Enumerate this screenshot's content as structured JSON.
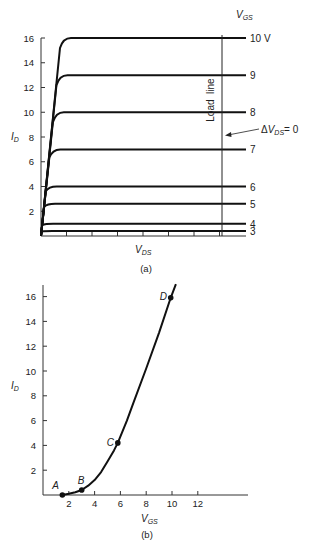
{
  "chart_data": [
    {
      "id": "a",
      "type": "line",
      "caption": "(a)",
      "title": "",
      "xlabel": "V_DS",
      "ylabel": "I_D",
      "legend_title": "V_GS",
      "yticks": [
        2,
        4,
        6,
        8,
        10,
        12,
        14,
        16
      ],
      "ylim": [
        0,
        16
      ],
      "x_minor_ticks": 7,
      "grid": false,
      "series": [
        {
          "name": "10 V",
          "vgs": 10,
          "saturation_current": 16,
          "label": "10 V"
        },
        {
          "name": "9",
          "vgs": 9,
          "saturation_current": 13,
          "label": "9"
        },
        {
          "name": "8",
          "vgs": 8,
          "saturation_current": 10,
          "label": "8"
        },
        {
          "name": "7",
          "vgs": 7,
          "saturation_current": 7,
          "label": "7"
        },
        {
          "name": "6",
          "vgs": 6,
          "saturation_current": 4,
          "label": "6"
        },
        {
          "name": "5",
          "vgs": 5,
          "saturation_current": 2.6,
          "label": "5"
        },
        {
          "name": "4",
          "vgs": 4,
          "saturation_current": 1,
          "label": "4"
        },
        {
          "name": "3",
          "vgs": 3,
          "saturation_current": 0.4,
          "label": "3"
        }
      ],
      "annotations": {
        "load_line_label": "Load  line",
        "delta_label": "ΔV",
        "delta_sub": "DS",
        "delta_suffix": "= 0"
      }
    },
    {
      "id": "b",
      "type": "line",
      "caption": "(b)",
      "title": "",
      "xlabel": "V_GS",
      "ylabel": "I_D",
      "xticks": [
        2,
        4,
        6,
        8,
        10,
        12
      ],
      "yticks": [
        2,
        4,
        6,
        8,
        10,
        12,
        14,
        16
      ],
      "xlim": [
        0,
        15.5
      ],
      "ylim": [
        0,
        16.8
      ],
      "grid": false,
      "points": [
        {
          "label": "A",
          "x": 1.5,
          "y": 0
        },
        {
          "label": "B",
          "x": 3,
          "y": 0.4
        },
        {
          "label": "C",
          "x": 5.8,
          "y": 4.2
        },
        {
          "label": "D",
          "x": 9.9,
          "y": 15.9
        }
      ],
      "curve": {
        "x": [
          1.5,
          2,
          2.5,
          3,
          3.5,
          4,
          4.5,
          5,
          5.5,
          5.8,
          6.5,
          7,
          8,
          9,
          9.9,
          10.3
        ],
        "y": [
          0,
          0.1,
          0.22,
          0.4,
          0.75,
          1.2,
          1.85,
          2.7,
          3.6,
          4.2,
          6.0,
          7.4,
          10.2,
          13.1,
          15.9,
          17.0
        ]
      }
    }
  ],
  "labels": {
    "a_ylabel": "I",
    "a_ylabel_sub": "D",
    "a_xlabel": "V",
    "a_xlabel_sub": "DS",
    "a_legend": "V",
    "a_legend_sub": "GS",
    "b_ylabel": "I",
    "b_ylabel_sub": "D",
    "b_xlabel": "V",
    "b_xlabel_sub": "GS"
  }
}
